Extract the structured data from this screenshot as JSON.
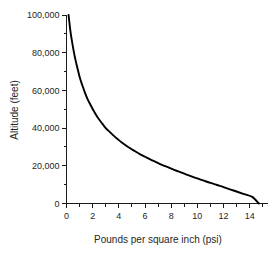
{
  "chart_data": {
    "type": "line",
    "title": "",
    "xlabel": "Pounds per square inch (psi)",
    "ylabel": "Altitude (feet)",
    "xlim": [
      0,
      15.4
    ],
    "ylim": [
      0,
      100000
    ],
    "grid": false,
    "legend": null,
    "x_ticks_major": [
      0,
      2,
      4,
      6,
      8,
      10,
      12,
      14
    ],
    "x_ticklabels": [
      "0",
      "2",
      "4",
      "6",
      "8",
      "10",
      "12",
      "14"
    ],
    "x_ticks_minor": [
      1,
      3,
      5,
      7,
      9,
      11,
      13,
      15
    ],
    "y_ticks_major": [
      0,
      20000,
      40000,
      60000,
      80000,
      100000
    ],
    "y_ticklabels": [
      "0",
      "20,000",
      "40,000",
      "60,000",
      "80,000",
      "100,000"
    ],
    "y_ticks_minor": [
      10000,
      30000,
      50000,
      70000,
      90000
    ],
    "series": [
      {
        "name": "Atmospheric pressure vs altitude",
        "color": "#000000",
        "x": [
          0.158,
          0.19,
          0.23,
          0.28,
          0.34,
          0.42,
          0.52,
          0.63,
          0.76,
          0.9,
          1.05,
          1.22,
          1.4,
          1.6,
          1.82,
          2.05,
          2.3,
          2.55,
          2.72,
          3.0,
          3.3,
          3.6,
          3.9,
          4.2,
          4.55,
          4.9,
          5.25,
          5.6,
          6.0,
          6.4,
          6.8,
          7.2,
          7.65,
          8.1,
          8.55,
          9.0,
          9.5,
          10.0,
          10.5,
          11.0,
          11.5,
          12.0,
          12.55,
          13.1,
          13.65,
          14.2,
          14.7
        ],
        "y": [
          100000,
          98000,
          95500,
          92500,
          89500,
          86000,
          82000,
          78000,
          74000,
          70000,
          66000,
          62500,
          59000,
          55500,
          52500,
          49500,
          46500,
          44000,
          42500,
          40000,
          38000,
          36000,
          34200,
          32500,
          30800,
          29200,
          27700,
          26200,
          24800,
          23400,
          22100,
          20800,
          19500,
          18200,
          17000,
          15800,
          14500,
          13300,
          12100,
          10900,
          9800,
          8700,
          7400,
          6100,
          4800,
          3500,
          0
        ]
      }
    ]
  },
  "axis_labels": {
    "x_title": "Pounds per square inch (psi)",
    "y_title": "Altitude (feet)"
  }
}
